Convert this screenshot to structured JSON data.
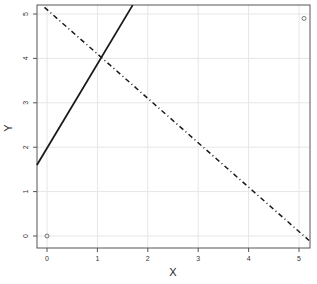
{
  "chart_data": {
    "type": "scatter",
    "title": "",
    "xlabel": "X",
    "ylabel": "Y",
    "xlim": [
      -0.2,
      5.2
    ],
    "ylim": [
      -0.2,
      5.2
    ],
    "grid": true,
    "x_ticks": [
      "0",
      "1",
      "2",
      "3",
      "4",
      "5"
    ],
    "y_ticks": [
      "0",
      "1",
      "2",
      "3",
      "4",
      "5"
    ],
    "series": [
      {
        "name": "points",
        "type": "scatter",
        "marker": "open-circle",
        "x": [
          0,
          5.1
        ],
        "y": [
          0,
          4.9
        ]
      },
      {
        "name": "solid-line",
        "type": "line",
        "style": "solid",
        "x": [
          -0.2,
          1.7
        ],
        "y": [
          1.6,
          5.2
        ]
      },
      {
        "name": "dashdot-line",
        "type": "line",
        "style": "dash-dot",
        "x": [
          -0.05,
          5.2
        ],
        "y": [
          5.15,
          -0.1
        ]
      }
    ]
  }
}
